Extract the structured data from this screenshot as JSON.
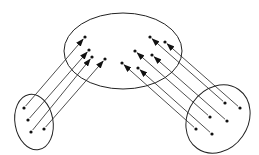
{
  "diagram": {
    "stroke_color": "#222222",
    "dot_color": "#111111",
    "ellipses": [
      {
        "id": "target-set",
        "cx": 123,
        "cy": 51,
        "rx": 59,
        "ry": 38,
        "rotate": 0
      },
      {
        "id": "left-source-set",
        "cx": 34,
        "cy": 122,
        "rx": 19,
        "ry": 28,
        "rotate": -10
      },
      {
        "id": "right-source-set",
        "cx": 218,
        "cy": 119,
        "rx": 30,
        "ry": 36,
        "rotate": 35
      }
    ],
    "arrows": [
      {
        "from": [
          24,
          108
        ],
        "to": [
          85,
          37
        ]
      },
      {
        "from": [
          28,
          120
        ],
        "to": [
          89,
          50
        ]
      },
      {
        "from": [
          31,
          132
        ],
        "to": [
          92,
          57
        ]
      },
      {
        "from": [
          44,
          129
        ],
        "to": [
          105,
          59
        ]
      },
      {
        "from": [
          225,
          103
        ],
        "to": [
          150,
          37
        ]
      },
      {
        "from": [
          240,
          108
        ],
        "to": [
          165,
          42
        ]
      },
      {
        "from": [
          210,
          117
        ],
        "to": [
          135,
          51
        ]
      },
      {
        "from": [
          227,
          121
        ],
        "to": [
          152,
          55
        ]
      },
      {
        "from": [
          196,
          129
        ],
        "to": [
          122,
          63
        ]
      },
      {
        "from": [
          212,
          134
        ],
        "to": [
          138,
          68
        ]
      }
    ]
  }
}
